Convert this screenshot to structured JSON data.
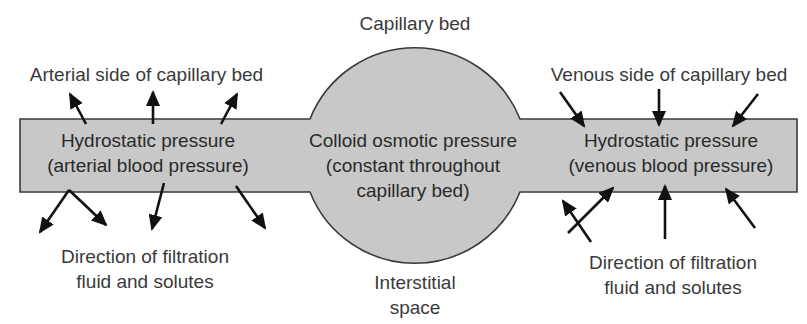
{
  "diagram": {
    "title": "Capillary bed",
    "arterial_side_label": "Arterial side of capillary bed",
    "venous_side_label": "Venous side of capillary bed",
    "arterial_pressure": {
      "line1": "Hydrostatic pressure",
      "line2": "(arterial blood pressure)"
    },
    "center_pressure": {
      "line1": "Colloid osmotic pressure",
      "line2": "(constant throughout",
      "line3": "capillary bed)"
    },
    "venous_pressure": {
      "line1": "Hydrostatic pressure",
      "line2": "(venous blood pressure)"
    },
    "left_filtration": {
      "line1": "Direction of filtration",
      "line2": "fluid and solutes"
    },
    "right_filtration": {
      "line1": "Direction of filtration",
      "line2": "fluid and solutes"
    },
    "interstitial": {
      "line1": "Interstitial",
      "line2": "space"
    },
    "colors": {
      "vessel_fill": "#c8c8c8",
      "vessel_stroke": "#3a3a3a",
      "arrow": "#111111",
      "text": "#333333"
    }
  }
}
